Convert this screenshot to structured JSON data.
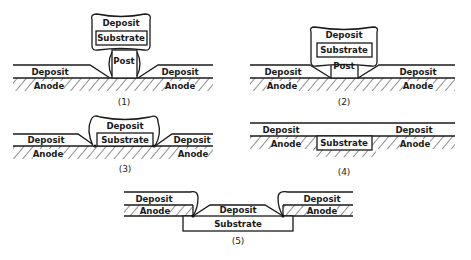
{
  "figure": {
    "panels": [
      {
        "id": "1",
        "caption": "(1)",
        "labels": {
          "cap": "Deposit",
          "substrate": "Substrate",
          "post": "Post",
          "left_deposit": "Deposit",
          "right_deposit": "Deposit",
          "left_anode": "Anode",
          "right_anode": "Anode"
        }
      },
      {
        "id": "2",
        "caption": "(2)",
        "labels": {
          "cap": "Deposit",
          "substrate": "Substrate",
          "post": "Post",
          "left_deposit": "Deposit",
          "right_deposit": "Deposit",
          "left_anode": "Anode",
          "right_anode": "Anode"
        }
      },
      {
        "id": "3",
        "caption": "(3)",
        "labels": {
          "cap": "Deposit",
          "substrate": "Substrate",
          "left_deposit": "Deposit",
          "right_deposit": "Deposit",
          "left_anode": "Anode",
          "right_anode": "Anode"
        }
      },
      {
        "id": "4",
        "caption": "(4)",
        "labels": {
          "substrate": "Substrate",
          "left_deposit": "Deposit",
          "right_deposit": "Deposit",
          "left_anode": "Anode",
          "right_anode": "Anode"
        }
      },
      {
        "id": "5",
        "caption": "(5)",
        "labels": {
          "center_deposit": "Deposit",
          "substrate": "Substrate",
          "left_deposit": "Deposit",
          "right_deposit": "Deposit",
          "left_anode": "Anode",
          "right_anode": "Anode"
        }
      }
    ]
  }
}
